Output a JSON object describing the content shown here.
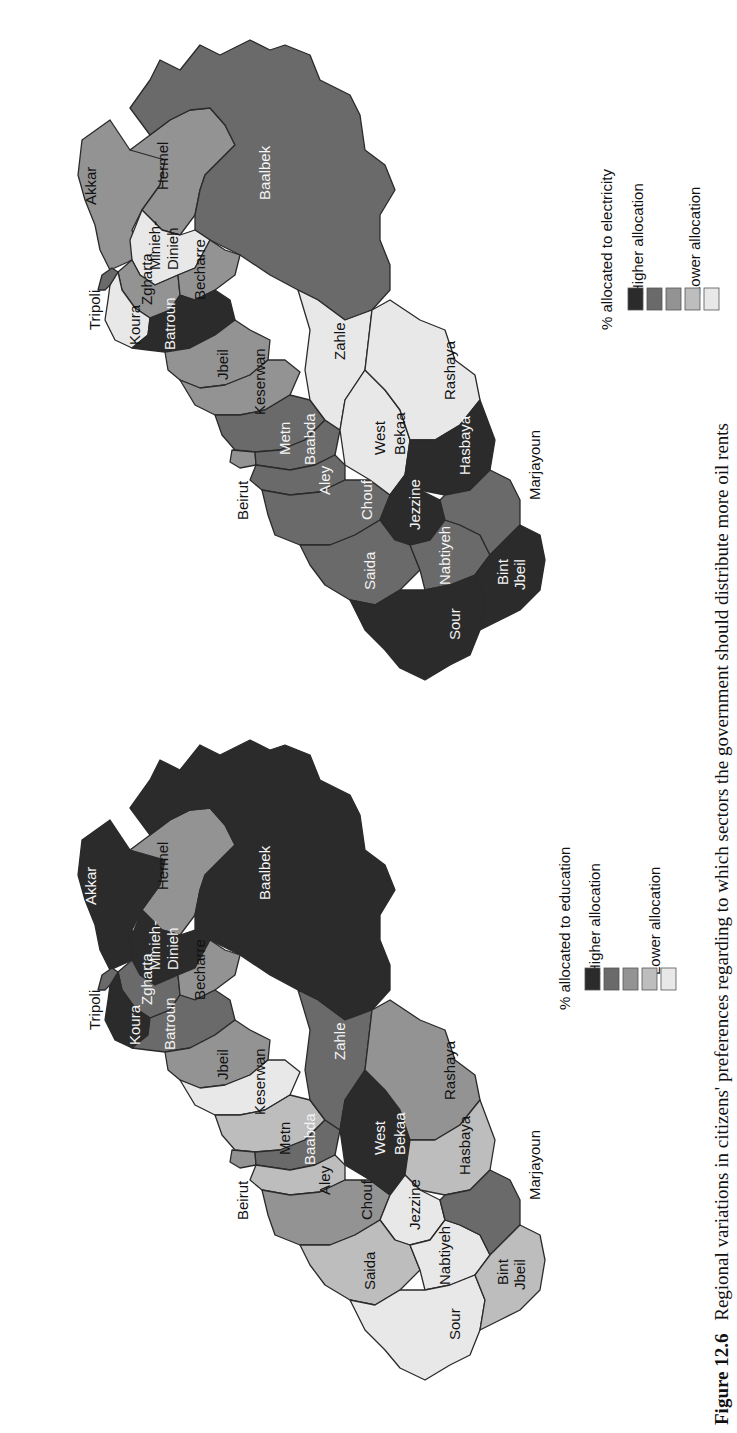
{
  "figure": {
    "number": "Figure 12.6",
    "caption": "Regional variations in citizens' preferences regarding to which sectors the government should distribute more oil rents"
  },
  "legend_scale": {
    "colors": [
      "#2b2b2b",
      "#6a6a6a",
      "#939393",
      "#bdbdbd",
      "#e8e8e8"
    ],
    "high_label": "Higher allocation",
    "low_label": "Lower allocation"
  },
  "maps": [
    {
      "id": "electricity",
      "legend_title": "% allocated to electricity",
      "cities": [
        "Tripoli",
        "Beirut"
      ],
      "districts": {
        "Akkar": 3,
        "Hermel": 3,
        "Baalbek": 2,
        "Minieh-Dinieh": 5,
        "Zgharta": 3,
        "Becharre": 3,
        "Koura": 5,
        "Batroun": 1,
        "Jbeil": 3,
        "Keserwan": 3,
        "Metn": 2,
        "Baabda": 2,
        "Aley": 2,
        "Chouf": 2,
        "Zahle": 5,
        "West Bekaa": 5,
        "Rashaya": 5,
        "Hasbaya": 1,
        "Jezzine": 1,
        "Saida": 2,
        "Nabtiyeh": 2,
        "Marjayoun": 2,
        "Sour": 1,
        "Bint Jbeil": 1
      }
    },
    {
      "id": "education",
      "legend_title": "% allocated to education",
      "cities": [
        "Tripoli",
        "Beirut"
      ],
      "districts": {
        "Akkar": 1,
        "Hermel": 3,
        "Baalbek": 1,
        "Minieh-Dinieh": 1,
        "Zgharta": 2,
        "Becharre": 3,
        "Koura": 1,
        "Batroun": 2,
        "Jbeil": 3,
        "Keserwan": 5,
        "Metn": 4,
        "Baabda": 2,
        "Aley": 4,
        "Chouf": 3,
        "Zahle": 2,
        "West Bekaa": 1,
        "Rashaya": 3,
        "Hasbaya": 4,
        "Jezzine": 5,
        "Saida": 4,
        "Nabtiyeh": 5,
        "Marjayoun": 2,
        "Sour": 5,
        "Bint Jbeil": 4
      }
    }
  ],
  "labels": {
    "Akkar": "Akkar",
    "Hermel": "Hermel",
    "Baalbek": "Baalbek",
    "Minieh1": "Minieh-",
    "Minieh2": "Dinieh",
    "Zgharta": "Zgharta",
    "Becharre": "Becharre",
    "Koura": "Koura",
    "Batroun": "Batroun",
    "Jbeil": "Jbeil",
    "Keserwan": "Keserwan",
    "Metn": "Metn",
    "Baabda": "Baabda",
    "Aley": "Aley",
    "Chouf": "Chouf",
    "Zahle": "Zahle",
    "West": "West",
    "Bekaa": "Bekaa",
    "Rashaya": "Rashaya",
    "Hasbaya": "Hasbaya",
    "Jezzine": "Jezzine",
    "Saida": "Saida",
    "Nabtiyeh": "Nabtiyeh",
    "Marjayoun": "Marjayoun",
    "Sour": "Sour",
    "Bint": "Bint",
    "Jbeil2": "Jbeil",
    "Tripoli": "Tripoli",
    "Beirut": "Beirut"
  },
  "chart_data": [
    {
      "type": "heatmap",
      "title": "% allocated to electricity",
      "legend": [
        "Higher allocation",
        "",
        "",
        "",
        "Lower allocation"
      ],
      "categories": [
        "Akkar",
        "Hermel",
        "Baalbek",
        "Minieh-Dinieh",
        "Zgharta",
        "Becharre",
        "Koura",
        "Batroun",
        "Jbeil",
        "Keserwan",
        "Metn",
        "Baabda",
        "Aley",
        "Chouf",
        "Zahle",
        "West Bekaa",
        "Rashaya",
        "Hasbaya",
        "Jezzine",
        "Saida",
        "Nabtiyeh",
        "Marjayoun",
        "Sour",
        "Bint Jbeil"
      ],
      "values": [
        3,
        3,
        2,
        5,
        3,
        3,
        5,
        1,
        3,
        3,
        2,
        2,
        2,
        2,
        5,
        5,
        5,
        1,
        1,
        2,
        2,
        2,
        1,
        1
      ],
      "value_note": "1 = highest allocation class (darkest), 5 = lowest allocation class (lightest)"
    },
    {
      "type": "heatmap",
      "title": "% allocated to education",
      "legend": [
        "Higher allocation",
        "",
        "",
        "",
        "Lower allocation"
      ],
      "categories": [
        "Akkar",
        "Hermel",
        "Baalbek",
        "Minieh-Dinieh",
        "Zgharta",
        "Becharre",
        "Koura",
        "Batroun",
        "Jbeil",
        "Keserwan",
        "Metn",
        "Baabda",
        "Aley",
        "Chouf",
        "Zahle",
        "West Bekaa",
        "Rashaya",
        "Hasbaya",
        "Jezzine",
        "Saida",
        "Nabtiyeh",
        "Marjayoun",
        "Sour",
        "Bint Jbeil"
      ],
      "values": [
        1,
        3,
        1,
        1,
        2,
        3,
        1,
        2,
        3,
        5,
        4,
        2,
        4,
        3,
        2,
        1,
        3,
        4,
        5,
        4,
        5,
        2,
        5,
        4
      ],
      "value_note": "1 = highest allocation class (darkest), 5 = lowest allocation class (lightest)"
    }
  ]
}
